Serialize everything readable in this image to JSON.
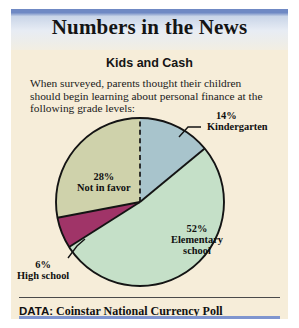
{
  "banner": {
    "title": "Numbers in the News"
  },
  "article": {
    "subtitle": "Kids and Cash",
    "intro": "When surveyed, parents thought their children should begin learning about personal finance at the following grade levels:"
  },
  "footer": {
    "key": "DATA:",
    "value": "Coinstar National Currency Poll"
  },
  "watermark": {
    "liberty_text": "LIBERTY",
    "motto_text": "IN GOD WE TRUST"
  },
  "colors": {
    "banner_blue": "#6f89c4",
    "paper": "#f6edd9",
    "kindergarten": "#a8c4cc",
    "elementary": "#c5e0c8",
    "high_school": "#a03468",
    "not_in_favor": "#cfd2ab",
    "outline": "#141414",
    "rule_blue": "#7f95cf"
  },
  "chart_data": {
    "type": "pie",
    "title": "Kids and Cash",
    "subtitle": "When surveyed, parents thought their children should begin learning about personal finance at the following grade levels:",
    "categories": [
      "Kindergarten",
      "Elementary school",
      "High school",
      "Not in favor"
    ],
    "values": [
      14,
      52,
      6,
      28
    ],
    "value_suffix": "%",
    "colors": [
      "#a8c4cc",
      "#c5e0c8",
      "#a03468",
      "#cfd2ab"
    ],
    "labels": [
      {
        "pct": "14%",
        "name": "Kindergarten",
        "name_line2": ""
      },
      {
        "pct": "52%",
        "name": "Elementary",
        "name_line2": "school"
      },
      {
        "pct": "6%",
        "name": "High school",
        "name_line2": ""
      },
      {
        "pct": "28%",
        "name": "Not in favor",
        "name_line2": ""
      }
    ],
    "legend": "none",
    "grid": false,
    "source": "Coinstar National Currency Poll"
  }
}
